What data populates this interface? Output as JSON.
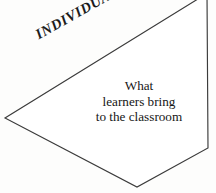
{
  "figure": {
    "name": "individual-banner-diagram",
    "background_color": "#fdfdfc",
    "shape": {
      "name": "pentagon-banner",
      "fill_color": "#ffffff",
      "stroke_color": "#3b3b3b",
      "stroke_width": 1.15,
      "points": "207,-6 208,148 137,187 5,118 206,-6",
      "vertices": [
        {
          "label": "top-right",
          "x": 207,
          "y": -6
        },
        {
          "label": "right",
          "x": 208,
          "y": 148
        },
        {
          "label": "bottom",
          "x": 137,
          "y": 187
        },
        {
          "label": "left",
          "x": 5,
          "y": 118
        }
      ]
    },
    "edge_label": {
      "text": "INDIVIDUAL",
      "rotation_deg": -29.2,
      "style": "bold-italic-serif",
      "color": "#1c1c1c"
    },
    "body_text": {
      "lines": [
        "What",
        "learners bring",
        "to the classroom"
      ],
      "color": "#161616",
      "align": "center"
    }
  }
}
